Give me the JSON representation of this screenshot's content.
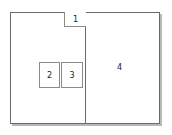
{
  "diagram": {
    "type": "layout-partition",
    "regions": [
      {
        "id": "1",
        "label": "1"
      },
      {
        "id": "2",
        "label": "2"
      },
      {
        "id": "3",
        "label": "3"
      },
      {
        "id": "4",
        "label": "4"
      }
    ],
    "colors": {
      "border": "#6a6a6a",
      "shadow": "#b8b8b8",
      "background": "#ffffff"
    }
  }
}
